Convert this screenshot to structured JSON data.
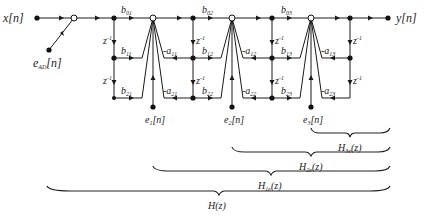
{
  "diagram": {
    "input_label": "x[n]",
    "output_label": "y[n]",
    "adc_noise_label": {
      "base": "e",
      "sub": "AD",
      "arg": "[n]"
    },
    "delay_label": "z",
    "delay_exp": "-1",
    "sections": [
      {
        "index": 1,
        "feedforward": [
          {
            "base": "b",
            "sub": "01"
          },
          {
            "base": "b",
            "sub": "11"
          },
          {
            "base": "b",
            "sub": "21"
          }
        ],
        "feedback": [
          {
            "base": "-a",
            "sub": "11"
          },
          {
            "base": "-a",
            "sub": "21"
          }
        ],
        "error": {
          "base": "e",
          "sub": "1",
          "arg": "[n]"
        }
      },
      {
        "index": 2,
        "feedforward": [
          {
            "base": "b",
            "sub": "02"
          },
          {
            "base": "b",
            "sub": "12"
          },
          {
            "base": "b",
            "sub": "22"
          }
        ],
        "feedback": [
          {
            "base": "-a",
            "sub": "12"
          },
          {
            "base": "-a",
            "sub": "22"
          }
        ],
        "error": {
          "base": "e",
          "sub": "2",
          "arg": "[n]"
        }
      },
      {
        "index": 3,
        "feedforward": [
          {
            "base": "b",
            "sub": "03"
          },
          {
            "base": "b",
            "sub": "13"
          },
          {
            "base": "b",
            "sub": "23"
          }
        ],
        "feedback": [
          {
            "base": "-a",
            "sub": "13"
          },
          {
            "base": "-a",
            "sub": "23"
          }
        ],
        "error": {
          "base": "e",
          "sub": "3",
          "arg": "[n]"
        }
      }
    ],
    "transfer_functions": [
      {
        "base": "H",
        "sub": "3e",
        "arg": "(z)"
      },
      {
        "base": "H",
        "sub": "2e",
        "arg": "(z)"
      },
      {
        "base": "H",
        "sub": "1e",
        "arg": "(z)"
      },
      {
        "base": "H",
        "sub": "",
        "arg": "(z)"
      }
    ]
  }
}
